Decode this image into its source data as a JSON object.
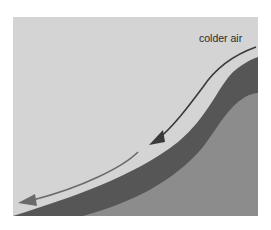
{
  "diagram": {
    "type": "cross-section",
    "labels": {
      "colder_air": "colder air"
    },
    "colors": {
      "sky": "#d4d4d4",
      "surface_layer": "#5a5a5a",
      "ground": "#8a8a8a",
      "arrow_upper": "#3a3a3a",
      "arrow_lower": "#6a6a6a",
      "page_background": "#ffffff"
    },
    "arrows": [
      {
        "id": "upper-flow",
        "direction": "downslope",
        "from": "top-right",
        "to": "middle"
      },
      {
        "id": "lower-flow",
        "direction": "downslope",
        "from": "middle",
        "to": "bottom-left"
      }
    ]
  }
}
